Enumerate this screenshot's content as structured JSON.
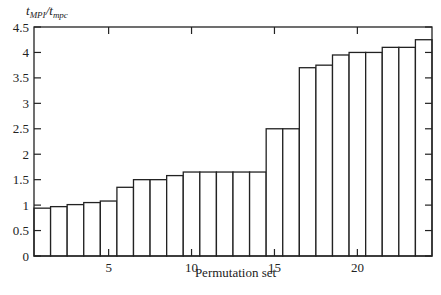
{
  "chart_data": {
    "type": "bar",
    "title": "",
    "ylabel": "t_MPI/t_mpc",
    "ylabel_parts": {
      "num": "t",
      "num_sub": "MPI",
      "den": "t",
      "den_sub": "mpc"
    },
    "xlabel": "Permutation set",
    "categories": [
      1,
      2,
      3,
      4,
      5,
      6,
      7,
      8,
      9,
      10,
      11,
      12,
      13,
      14,
      15,
      16,
      17,
      18,
      19,
      20,
      21,
      22,
      23,
      24
    ],
    "values": [
      0.94,
      0.97,
      1.01,
      1.05,
      1.08,
      1.35,
      1.5,
      1.5,
      1.58,
      1.65,
      1.65,
      1.65,
      1.65,
      1.65,
      2.5,
      2.5,
      3.7,
      3.75,
      3.95,
      4.0,
      4.0,
      4.1,
      4.1,
      4.25
    ],
    "xlim": [
      0.5,
      24.5
    ],
    "ylim": [
      0,
      4.5
    ],
    "xticks": [
      5,
      10,
      15,
      20
    ],
    "yticks": [
      0,
      0.5,
      1,
      1.5,
      2,
      2.5,
      3,
      3.5,
      4,
      4.5
    ],
    "ytick_labels": [
      "0",
      "0.5",
      "1",
      "1.5",
      "2",
      "2.5",
      "3",
      "3.5",
      "4",
      "4.5"
    ],
    "xtick_labels": [
      "5",
      "10",
      "15",
      "20"
    ],
    "grid": false,
    "legend": null,
    "bar_fill": "#ffffff",
    "bar_edge": "#222222"
  }
}
